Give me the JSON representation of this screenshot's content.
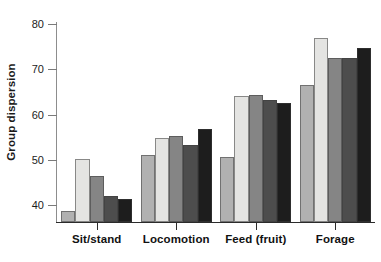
{
  "chart_data": {
    "type": "bar",
    "title": "",
    "xlabel": "",
    "ylabel": "Group dispersion",
    "categories": [
      "Sit/stand",
      "Locomotion",
      "Feed (fruit)",
      "Forage"
    ],
    "ylim": [
      36.3,
      80
    ],
    "yticks": [
      40,
      50,
      60,
      70,
      80
    ],
    "ytick_labels": [
      "40",
      "50",
      "60",
      "70",
      "80"
    ],
    "grid": false,
    "legend": "none",
    "axis_note": "y-axis truncated; bars originate below the 40 tick",
    "series": [
      {
        "name": "series-1",
        "color": "#b1b1b1",
        "values": [
          38.8,
          51.0,
          50.6,
          66.5
        ]
      },
      {
        "name": "series-2",
        "color": "#e4e4e2",
        "values": [
          50.3,
          54.8,
          64.2,
          77.0
        ]
      },
      {
        "name": "series-3",
        "color": "#858585",
        "values": [
          46.4,
          55.2,
          64.4,
          72.4
        ]
      },
      {
        "name": "series-4",
        "color": "#4d4d4d",
        "values": [
          42.0,
          53.2,
          63.2,
          72.6
        ]
      },
      {
        "name": "series-5",
        "color": "#1d1d1d",
        "values": [
          41.4,
          56.8,
          62.6,
          74.7
        ]
      }
    ]
  }
}
